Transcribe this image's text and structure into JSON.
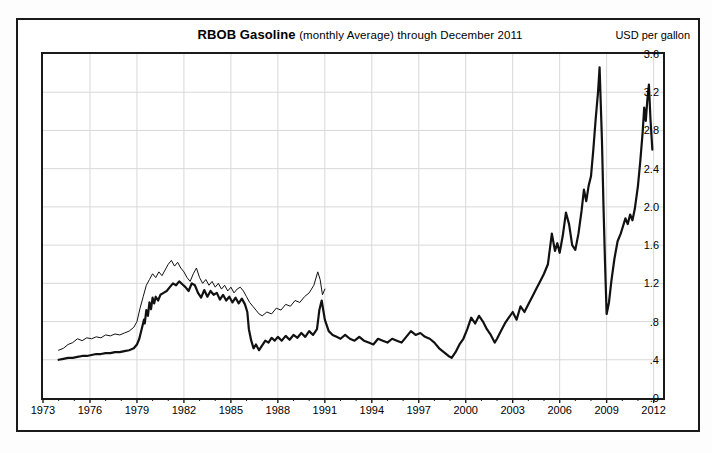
{
  "header": {
    "title_main": "RBOB Gasoline",
    "title_sub": "(monthly Average) through December 2011",
    "unit_label": "USD per gallon"
  },
  "chart_data": {
    "type": "line",
    "title": "RBOB Gasoline (monthly Average) through December 2011",
    "xlabel": "",
    "ylabel": "USD per gallon",
    "xlim": [
      1973,
      2012.6
    ],
    "ylim": [
      0.0,
      3.6
    ],
    "grid": true,
    "legend_position": "none",
    "ytick_labels": [
      "3.6",
      "3.2",
      "2.8",
      "2.4",
      "2.0",
      "1.6",
      "1.2",
      ".8",
      ".4",
      ".0"
    ],
    "ytick_values": [
      3.6,
      3.2,
      2.8,
      2.4,
      2.0,
      1.6,
      1.2,
      0.8,
      0.4,
      0.0
    ],
    "xtick_labels": [
      "1973",
      "1976",
      "1979",
      "1982",
      "1985",
      "1988",
      "1991",
      "1994",
      "1997",
      "2000",
      "2003",
      "2006",
      "2009",
      "2012"
    ],
    "xtick_values": [
      1973,
      1976,
      1979,
      1982,
      1985,
      1988,
      1991,
      1994,
      1997,
      2000,
      2003,
      2006,
      2009,
      2012
    ],
    "minor_xticks_every": 1,
    "series": [
      {
        "name": "nominal-price",
        "style": "thick-black",
        "color": "#111111",
        "width": 2.2,
        "x": [
          1974.0,
          1974.3,
          1974.6,
          1974.9,
          1975.2,
          1975.5,
          1975.8,
          1976.1,
          1976.4,
          1976.7,
          1977.0,
          1977.3,
          1977.6,
          1977.9,
          1978.2,
          1978.5,
          1978.8,
          1979.0,
          1979.15,
          1979.3,
          1979.45,
          1979.5,
          1979.6,
          1979.7,
          1979.8,
          1979.9,
          1980.0,
          1980.1,
          1980.2,
          1980.35,
          1980.5,
          1980.7,
          1980.9,
          1981.1,
          1981.3,
          1981.5,
          1981.7,
          1981.9,
          1982.1,
          1982.3,
          1982.5,
          1982.7,
          1982.9,
          1983.1,
          1983.3,
          1983.5,
          1983.7,
          1983.9,
          1984.1,
          1984.3,
          1984.5,
          1984.7,
          1984.9,
          1985.1,
          1985.3,
          1985.5,
          1985.7,
          1985.9,
          1986.05,
          1986.15,
          1986.3,
          1986.45,
          1986.6,
          1986.8,
          1987.0,
          1987.2,
          1987.4,
          1987.6,
          1987.8,
          1988.0,
          1988.25,
          1988.5,
          1988.75,
          1989.0,
          1989.25,
          1989.5,
          1989.75,
          1990.0,
          1990.25,
          1990.5,
          1990.65,
          1990.8,
          1991.0,
          1991.25,
          1991.5,
          1991.75,
          1992.0,
          1992.3,
          1992.6,
          1992.9,
          1993.2,
          1993.5,
          1993.8,
          1994.1,
          1994.4,
          1994.7,
          1995.0,
          1995.3,
          1995.6,
          1995.9,
          1996.2,
          1996.5,
          1996.8,
          1997.1,
          1997.4,
          1997.7,
          1998.0,
          1998.3,
          1998.6,
          1998.9,
          1999.1,
          1999.35,
          1999.6,
          1999.85,
          2000.1,
          2000.35,
          2000.6,
          2000.85,
          2001.1,
          2001.35,
          2001.6,
          2001.85,
          2002.0,
          2002.25,
          2002.5,
          2002.75,
          2003.0,
          2003.25,
          2003.5,
          2003.75,
          2004.0,
          2004.25,
          2004.5,
          2004.75,
          2005.0,
          2005.25,
          2005.5,
          2005.7,
          2005.85,
          2006.0,
          2006.2,
          2006.4,
          2006.6,
          2006.8,
          2007.0,
          2007.2,
          2007.4,
          2007.55,
          2007.7,
          2007.85,
          2008.0,
          2008.15,
          2008.3,
          2008.45,
          2008.55,
          2008.7,
          2008.8,
          2008.9,
          2009.0,
          2009.15,
          2009.3,
          2009.5,
          2009.7,
          2009.9,
          2010.05,
          2010.2,
          2010.35,
          2010.5,
          2010.65,
          2010.8,
          2011.0,
          2011.15,
          2011.3,
          2011.4,
          2011.5,
          2011.6,
          2011.7,
          2011.8,
          2011.92
        ],
        "y": [
          0.4,
          0.41,
          0.42,
          0.42,
          0.43,
          0.44,
          0.44,
          0.45,
          0.46,
          0.46,
          0.47,
          0.47,
          0.48,
          0.48,
          0.49,
          0.5,
          0.52,
          0.56,
          0.62,
          0.72,
          0.82,
          0.78,
          0.92,
          0.86,
          1.0,
          0.93,
          1.05,
          0.99,
          1.06,
          1.02,
          1.08,
          1.1,
          1.12,
          1.16,
          1.2,
          1.18,
          1.22,
          1.19,
          1.16,
          1.12,
          1.2,
          1.18,
          1.1,
          1.05,
          1.13,
          1.06,
          1.12,
          1.08,
          1.1,
          1.03,
          1.08,
          1.02,
          1.06,
          1.0,
          1.05,
          0.99,
          1.04,
          0.98,
          0.9,
          0.72,
          0.6,
          0.52,
          0.56,
          0.5,
          0.55,
          0.6,
          0.58,
          0.63,
          0.6,
          0.64,
          0.6,
          0.65,
          0.61,
          0.66,
          0.63,
          0.68,
          0.64,
          0.7,
          0.66,
          0.72,
          0.92,
          1.02,
          0.82,
          0.7,
          0.66,
          0.64,
          0.62,
          0.66,
          0.62,
          0.6,
          0.64,
          0.6,
          0.58,
          0.56,
          0.62,
          0.6,
          0.58,
          0.62,
          0.6,
          0.58,
          0.64,
          0.7,
          0.66,
          0.68,
          0.64,
          0.62,
          0.58,
          0.52,
          0.48,
          0.44,
          0.42,
          0.48,
          0.56,
          0.62,
          0.72,
          0.84,
          0.78,
          0.86,
          0.8,
          0.72,
          0.66,
          0.58,
          0.62,
          0.7,
          0.78,
          0.84,
          0.9,
          0.82,
          0.96,
          0.9,
          0.98,
          1.06,
          1.14,
          1.22,
          1.3,
          1.4,
          1.72,
          1.54,
          1.62,
          1.52,
          1.7,
          1.94,
          1.82,
          1.6,
          1.55,
          1.72,
          1.96,
          2.18,
          2.06,
          2.22,
          2.32,
          2.6,
          2.92,
          3.2,
          3.46,
          2.7,
          2.0,
          1.4,
          0.88,
          1.0,
          1.22,
          1.46,
          1.64,
          1.72,
          1.8,
          1.88,
          1.82,
          1.92,
          1.86,
          1.98,
          2.22,
          2.48,
          2.78,
          3.04,
          2.9,
          3.12,
          3.28,
          2.92,
          2.6
        ]
      },
      {
        "name": "inflation-adjusted-price",
        "style": "thin-black",
        "color": "#111111",
        "width": 1.0,
        "x": [
          1974.0,
          1974.3,
          1974.6,
          1974.9,
          1975.2,
          1975.5,
          1975.8,
          1976.1,
          1976.4,
          1976.7,
          1977.0,
          1977.3,
          1977.6,
          1977.9,
          1978.2,
          1978.5,
          1978.8,
          1979.0,
          1979.2,
          1979.4,
          1979.6,
          1979.8,
          1980.0,
          1980.2,
          1980.4,
          1980.6,
          1980.8,
          1981.0,
          1981.2,
          1981.4,
          1981.6,
          1981.8,
          1982.0,
          1982.2,
          1982.4,
          1982.6,
          1982.8,
          1983.0,
          1983.2,
          1983.4,
          1983.6,
          1983.8,
          1984.0,
          1984.2,
          1984.4,
          1984.6,
          1984.8,
          1985.0,
          1985.2,
          1985.4,
          1985.6,
          1985.8,
          1986.0,
          1986.2,
          1986.4,
          1986.6,
          1986.8,
          1987.0,
          1987.3,
          1987.6,
          1987.9,
          1988.2,
          1988.5,
          1988.8,
          1989.1,
          1989.4,
          1989.7,
          1990.0,
          1990.3,
          1990.55,
          1990.7,
          1990.85,
          1991.0
        ],
        "y": [
          0.5,
          0.52,
          0.56,
          0.58,
          0.62,
          0.6,
          0.63,
          0.62,
          0.64,
          0.63,
          0.66,
          0.65,
          0.67,
          0.66,
          0.68,
          0.7,
          0.74,
          0.8,
          0.94,
          1.06,
          1.18,
          1.24,
          1.3,
          1.26,
          1.32,
          1.28,
          1.34,
          1.4,
          1.44,
          1.38,
          1.42,
          1.36,
          1.32,
          1.26,
          1.22,
          1.3,
          1.36,
          1.26,
          1.2,
          1.24,
          1.18,
          1.22,
          1.16,
          1.2,
          1.14,
          1.18,
          1.12,
          1.16,
          1.1,
          1.14,
          1.16,
          1.12,
          1.06,
          1.0,
          0.96,
          0.92,
          0.88,
          0.86,
          0.9,
          0.88,
          0.94,
          0.92,
          0.98,
          0.96,
          1.02,
          1.0,
          1.06,
          1.1,
          1.18,
          1.32,
          1.24,
          1.08,
          1.14
        ]
      }
    ]
  }
}
